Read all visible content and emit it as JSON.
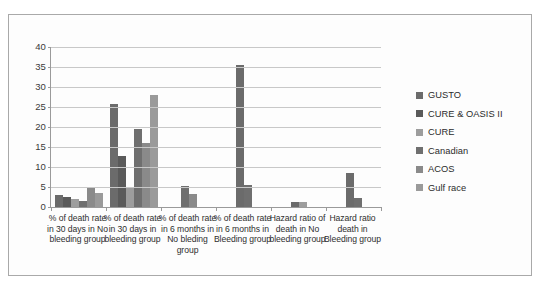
{
  "chart_data": {
    "type": "bar",
    "title": "",
    "xlabel": "",
    "ylabel": "",
    "ylim": [
      0,
      40
    ],
    "ytick_step": 5,
    "yticks": [
      40,
      35,
      30,
      25,
      20,
      15,
      10,
      5,
      0
    ],
    "grid": true,
    "legend_position": "right",
    "categories": [
      "% of death rate in 30 days in No bleeding group",
      "% of death rate in 30 days in bleeding group",
      "% of death rate in 6 months in No bleding group",
      "% of death rate in 6 months in Bleeding group",
      "Hazard ratio of death in No bleeding group",
      "Hazard ratio death in Bleeding group"
    ],
    "series": [
      {
        "name": "GUSTO",
        "color": "#6b6b6b",
        "values": [
          3.0,
          25.7,
          null,
          35.5,
          1.3,
          8.5
        ]
      },
      {
        "name": "CURE & OASIS II",
        "color": "#5a5a5a",
        "values": [
          2.5,
          12.8,
          null,
          null,
          null,
          null
        ]
      },
      {
        "name": "CURE",
        "color": "#9d9d9d",
        "values": [
          1.9,
          4.7,
          null,
          null,
          1.2,
          null
        ]
      },
      {
        "name": "Canadian",
        "color": "#6f6f6f",
        "values": [
          1.4,
          19.4,
          5.2,
          5.5,
          null,
          2.3
        ]
      },
      {
        "name": "ACOS",
        "color": "#8a8a8a",
        "values": [
          4.8,
          15.9,
          3.2,
          null,
          null,
          null
        ]
      },
      {
        "name": "Gulf race",
        "color": "#9a9a9a",
        "values": [
          3.4,
          28.0,
          null,
          null,
          null,
          null
        ]
      }
    ]
  }
}
